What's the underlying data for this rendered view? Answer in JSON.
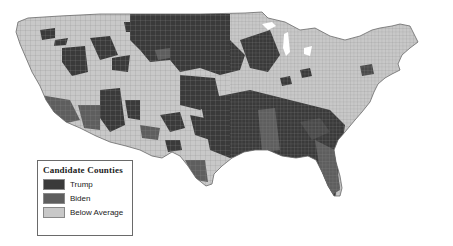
{
  "map": {
    "title": "Candidate Counties",
    "region": "Contiguous United States (county level)"
  },
  "legend": {
    "title": "Candidate Counties",
    "items": [
      {
        "label": "Trump",
        "color": "#3a3a3a"
      },
      {
        "label": "Biden",
        "color": "#5e5e5e"
      },
      {
        "label": "Below Average",
        "color": "#c8c8c8"
      }
    ]
  },
  "colors": {
    "trump": "#3a3a3a",
    "biden": "#5e5e5e",
    "below_average": "#c8c8c8",
    "border": "#7a7a7a",
    "background": "#ffffff"
  }
}
